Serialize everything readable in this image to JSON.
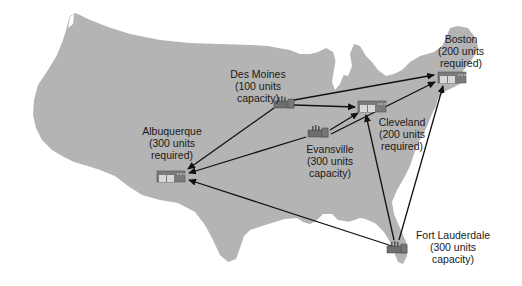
{
  "diagram": {
    "type": "distribution-network-map",
    "colors": {
      "map_fill": "#b4b4b4",
      "background": "#ffffff",
      "arrow": "#111111",
      "icon_fill": "#6e6e6e",
      "text": "#1a1a1a"
    },
    "factories": [
      {
        "id": "des-moines",
        "name": "Des Moines",
        "line2": "(100 units",
        "line3": "capacity)"
      },
      {
        "id": "evansville",
        "name": "Evansville",
        "line2": "(300 units",
        "line3": "capacity)"
      },
      {
        "id": "fort-lauderdale",
        "name": "Fort Lauderdale",
        "line2": "(300 units",
        "line3": "capacity)"
      }
    ],
    "warehouses": [
      {
        "id": "boston",
        "name": "Boston",
        "line2": "(200 units",
        "line3": "required)"
      },
      {
        "id": "cleveland",
        "name": "Cleveland",
        "line2": "(200 units",
        "line3": "required)"
      },
      {
        "id": "albuquerque",
        "name": "Albuquerque",
        "line2": "(300 units",
        "line3": "required)"
      }
    ],
    "routes": [
      {
        "from": "Des Moines",
        "to": "Boston"
      },
      {
        "from": "Des Moines",
        "to": "Cleveland"
      },
      {
        "from": "Des Moines",
        "to": "Albuquerque"
      },
      {
        "from": "Evansville",
        "to": "Boston"
      },
      {
        "from": "Evansville",
        "to": "Cleveland"
      },
      {
        "from": "Evansville",
        "to": "Albuquerque"
      },
      {
        "from": "Fort Lauderdale",
        "to": "Boston"
      },
      {
        "from": "Fort Lauderdale",
        "to": "Cleveland"
      },
      {
        "from": "Fort Lauderdale",
        "to": "Albuquerque"
      }
    ]
  }
}
